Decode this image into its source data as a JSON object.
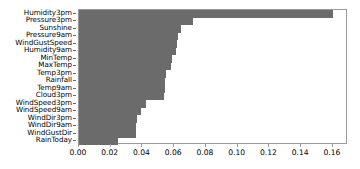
{
  "chart_data": {
    "type": "bar",
    "orientation": "horizontal",
    "title": "",
    "xlabel": "",
    "ylabel": "",
    "xlim": [
      0.0,
      0.1695
    ],
    "grid": false,
    "legend": null,
    "bar_color": "#6b6b6b",
    "axis_color": "#9a9a9a",
    "xticks": [
      "0.00",
      "0.02",
      "0.04",
      "0.06",
      "0.08",
      "0.10",
      "0.12",
      "0.14",
      "0.16"
    ],
    "xtick_values": [
      0.0,
      0.02,
      0.04,
      0.06,
      0.08,
      0.1,
      0.12,
      0.14,
      0.16
    ],
    "categories": [
      "RainToday",
      "WindGustDir",
      "WindDir9am",
      "WindDir3pm",
      "WindSpeed9am",
      "WindSpeed3pm",
      "Cloud3pm",
      "Temp9am",
      "Rainfall",
      "Temp3pm",
      "MaxTemp",
      "MinTemp",
      "Humidity9am",
      "WindGustSpeed",
      "Pressure9am",
      "Sunshine",
      "Pressure3pm",
      "Humidity3pm"
    ],
    "values": [
      0.0245,
      0.0358,
      0.0359,
      0.0363,
      0.039,
      0.0422,
      0.0535,
      0.0541,
      0.0542,
      0.0547,
      0.0579,
      0.0586,
      0.0611,
      0.0617,
      0.0623,
      0.0643,
      0.0718,
      0.1601
    ]
  }
}
